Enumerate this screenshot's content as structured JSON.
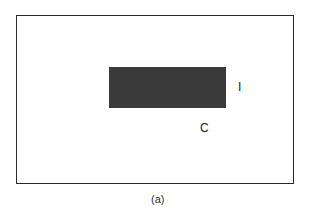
{
  "figure": {
    "labels": {
      "i": "I",
      "c": "C"
    },
    "caption": "(a)",
    "colors": {
      "frame": "#2a2a2a",
      "block": "#3a3a3a",
      "background": "#ffffff"
    }
  }
}
